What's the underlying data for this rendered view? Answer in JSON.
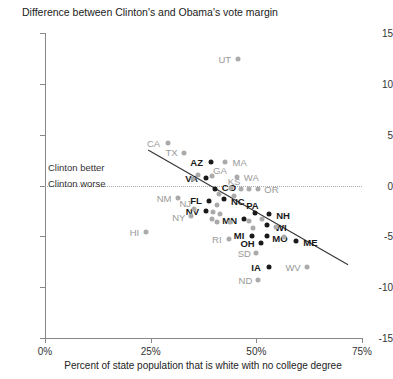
{
  "chart_data": {
    "type": "scatter",
    "title": "Difference between Clinton's and Obama's vote margin",
    "xlabel": "Percent of state population that is white with no college degree",
    "ylabel": "",
    "xlim": [
      0,
      75
    ],
    "ylim": [
      -15,
      15
    ],
    "xticks": [
      0,
      25,
      50,
      75
    ],
    "xtick_labels": [
      "0%",
      "25%",
      "50%",
      "75%"
    ],
    "yticks": [
      15,
      10,
      5,
      0,
      -5,
      -10,
      -15
    ],
    "ytick_labels": [
      "15",
      "10",
      "5",
      "0",
      "-5",
      "-10",
      "-15"
    ],
    "grid": false,
    "legend": null,
    "zero_reference_line": 0,
    "annotations": [
      {
        "text": "Clinton better",
        "x": 1.0,
        "y": 1.5
      },
      {
        "text": "Clinton worse",
        "x": 1.0,
        "y": -1.2
      }
    ],
    "trend_line": {
      "x0": 24.4,
      "y0": 3.5,
      "x1": 71.7,
      "y1": -7.8
    },
    "points": [
      {
        "state": "UT",
        "x": 45.6,
        "y": 12.4,
        "highlight": false,
        "label_dx": -13,
        "label_dy": 0
      },
      {
        "state": "CA",
        "x": 29.0,
        "y": 4.2,
        "highlight": false,
        "label_dx": -14,
        "label_dy": 0
      },
      {
        "state": "TX",
        "x": 33.0,
        "y": 3.2,
        "highlight": false,
        "label_dx": -13,
        "label_dy": -1
      },
      {
        "state": "AZ",
        "x": 39.2,
        "y": 2.3,
        "highlight": true,
        "label_dx": -14,
        "label_dy": 0
      },
      {
        "state": "MA",
        "x": 42.5,
        "y": 2.3,
        "highlight": false,
        "label_dx": 15,
        "label_dy": 0
      },
      {
        "state": "VA",
        "x": 38.0,
        "y": 0.7,
        "highlight": true,
        "label_dx": -14,
        "label_dy": 0
      },
      {
        "state": "GA",
        "x": 39.5,
        "y": 0.9,
        "highlight": false,
        "label_dx": 8,
        "label_dy": -6
      },
      {
        "state": "WA",
        "x": 45.5,
        "y": 0.8,
        "highlight": false,
        "label_dx": 14,
        "label_dy": 0
      },
      {
        "state": "CO",
        "x": 40.2,
        "y": -0.3,
        "highlight": true,
        "label_dx": 14,
        "label_dy": -2
      },
      {
        "state": "KS",
        "x": 44.0,
        "y": -0.2,
        "highlight": false,
        "label_dx": 3,
        "label_dy": -7
      },
      {
        "state": "OR",
        "x": 50.5,
        "y": -0.3,
        "highlight": false,
        "label_dx": 13,
        "label_dy": 0
      },
      {
        "state": "NC",
        "x": 42.3,
        "y": -1.3,
        "highlight": true,
        "label_dx": 14,
        "label_dy": 2
      },
      {
        "state": "FL",
        "x": 38.8,
        "y": -1.5,
        "highlight": true,
        "label_dx": -13,
        "label_dy": -1
      },
      {
        "state": "NM",
        "x": 31.5,
        "y": -1.2,
        "highlight": false,
        "label_dx": -14,
        "label_dy": 0
      },
      {
        "state": "NV",
        "x": 38.2,
        "y": -2.5,
        "highlight": true,
        "label_dx": -14,
        "label_dy": 0
      },
      {
        "state": "NJ",
        "x": 35.3,
        "y": -2.3,
        "highlight": false,
        "label_dx": -9,
        "label_dy": -6
      },
      {
        "state": "NY",
        "x": 34.5,
        "y": -3.0,
        "highlight": false,
        "label_dx": -12,
        "label_dy": 1
      },
      {
        "state": "HI",
        "x": 24.0,
        "y": -4.6,
        "highlight": false,
        "label_dx": -12,
        "label_dy": 0
      },
      {
        "state": "MN",
        "x": 47.0,
        "y": -3.3,
        "highlight": true,
        "label_dx": -14,
        "label_dy": 1
      },
      {
        "state": "PA",
        "x": 49.8,
        "y": -2.7,
        "highlight": true,
        "label_dx": -3,
        "label_dy": -8
      },
      {
        "state": "NH",
        "x": 53.0,
        "y": -2.8,
        "highlight": true,
        "label_dx": 14,
        "label_dy": 1
      },
      {
        "state": "WI",
        "x": 52.5,
        "y": -3.9,
        "highlight": true,
        "label_dx": 14,
        "label_dy": 2
      },
      {
        "state": "RI",
        "x": 43.5,
        "y": -5.3,
        "highlight": false,
        "label_dx": -12,
        "label_dy": 0
      },
      {
        "state": "MI",
        "x": 49.0,
        "y": -5.0,
        "highlight": true,
        "label_dx": -13,
        "label_dy": -1
      },
      {
        "state": "MO",
        "x": 52.5,
        "y": -5.0,
        "highlight": true,
        "label_dx": 13,
        "label_dy": 2
      },
      {
        "state": "OH",
        "x": 51.0,
        "y": -5.7,
        "highlight": true,
        "label_dx": -13,
        "label_dy": 0
      },
      {
        "state": "SD",
        "x": 50.0,
        "y": -6.6,
        "highlight": false,
        "label_dx": -12,
        "label_dy": 0
      },
      {
        "state": "ME",
        "x": 59.5,
        "y": -5.5,
        "highlight": true,
        "label_dx": 14,
        "label_dy": 1
      },
      {
        "state": "IA",
        "x": 53.0,
        "y": -8.0,
        "highlight": true,
        "label_dx": -13,
        "label_dy": 0
      },
      {
        "state": "WV",
        "x": 62.0,
        "y": -8.0,
        "highlight": false,
        "label_dx": -14,
        "label_dy": 0
      },
      {
        "state": "ND",
        "x": 50.5,
        "y": -9.3,
        "highlight": false,
        "label_dx": -13,
        "label_dy": 0
      },
      {
        "state": "",
        "x": 35.0,
        "y": 0.6,
        "highlight": false,
        "label_dx": 0,
        "label_dy": 0
      },
      {
        "state": "",
        "x": 41.2,
        "y": -0.8,
        "highlight": false,
        "label_dx": 0,
        "label_dy": 0
      },
      {
        "state": "",
        "x": 46.4,
        "y": -0.3,
        "highlight": false,
        "label_dx": 0,
        "label_dy": 0
      },
      {
        "state": "",
        "x": 48.3,
        "y": -0.3,
        "highlight": false,
        "label_dx": 0,
        "label_dy": 0
      },
      {
        "state": "",
        "x": 40.8,
        "y": -1.9,
        "highlight": false,
        "label_dx": 0,
        "label_dy": 0
      },
      {
        "state": "",
        "x": 39.8,
        "y": -2.6,
        "highlight": false,
        "label_dx": 0,
        "label_dy": 0
      },
      {
        "state": "",
        "x": 41.5,
        "y": -2.8,
        "highlight": false,
        "label_dx": 0,
        "label_dy": 0
      },
      {
        "state": "",
        "x": 39.6,
        "y": -3.3,
        "highlight": false,
        "label_dx": 0,
        "label_dy": 0
      },
      {
        "state": "",
        "x": 40.6,
        "y": -3.6,
        "highlight": false,
        "label_dx": 0,
        "label_dy": 0
      },
      {
        "state": "",
        "x": 43.8,
        "y": -3.6,
        "highlight": false,
        "label_dx": 0,
        "label_dy": 0
      },
      {
        "state": "",
        "x": 44.6,
        "y": -1.0,
        "highlight": false,
        "label_dx": 0,
        "label_dy": 0
      },
      {
        "state": "",
        "x": 48.3,
        "y": -3.5,
        "highlight": false,
        "label_dx": 0,
        "label_dy": 0
      },
      {
        "state": "",
        "x": 51.4,
        "y": -3.3,
        "highlight": false,
        "label_dx": 0,
        "label_dy": 0
      },
      {
        "state": "",
        "x": 54.6,
        "y": -4.1,
        "highlight": false,
        "label_dx": 0,
        "label_dy": 0
      },
      {
        "state": "",
        "x": 56.5,
        "y": -5.1,
        "highlight": false,
        "label_dx": 0,
        "label_dy": 0
      },
      {
        "state": "",
        "x": 49.2,
        "y": -4.2,
        "highlight": false,
        "label_dx": 0,
        "label_dy": 0
      },
      {
        "state": "",
        "x": 36.2,
        "y": 1.0,
        "highlight": false,
        "label_dx": 0,
        "label_dy": 0
      }
    ]
  },
  "colors": {
    "highlight_point": "#1a1a1a",
    "muted_point": "#aaaaaa",
    "axis": "#888888",
    "zero_line": "#aaaaaa",
    "trend_line": "#333333",
    "text": "#222222"
  }
}
